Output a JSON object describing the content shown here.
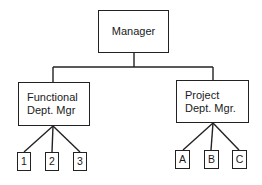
{
  "diagram": {
    "type": "org-chart",
    "root": {
      "label": "Manager"
    },
    "branches": [
      {
        "label_line1": "Functional",
        "label_line2": "Dept. Mgr",
        "children": [
          "1",
          "2",
          "3"
        ]
      },
      {
        "label_line1": "Project",
        "label_line2": "Dept. Mgr.",
        "children": [
          "A",
          "B",
          "C"
        ]
      }
    ],
    "colors": {
      "line": "#222222",
      "background": "#ffffff",
      "text": "#1a1a1a"
    }
  }
}
